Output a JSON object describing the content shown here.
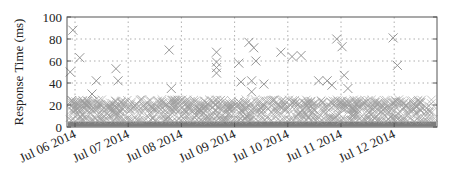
{
  "chart_data": {
    "type": "scatter",
    "title": "",
    "xlabel": "",
    "ylabel": "Response Time (ms)",
    "ylim": [
      0,
      100
    ],
    "yticks": [
      0,
      20,
      40,
      60,
      80,
      100
    ],
    "xticks": [
      "Jul 06 2014",
      "Jul 07 2014",
      "Jul 08 2014",
      "Jul 09 2014",
      "Jul 10 2014",
      "Jul 11 2014",
      "Jul 12 2014"
    ],
    "xlim_days": [
      -0.15,
      6.85
    ],
    "grid": true,
    "legend": null,
    "marker": "x",
    "series": [
      {
        "name": "response_time",
        "description": "Dense band of samples 0-5 ms across full range plus crowded cluster around 15-25 ms",
        "dense_band_ms": [
          0,
          5
        ],
        "cluster_band_ms": [
          15,
          25
        ],
        "outliers": [
          {
            "day": -0.04,
            "ms": 88
          },
          {
            "day": 0.09,
            "ms": 63
          },
          {
            "day": -0.09,
            "ms": 50
          },
          {
            "day": 0.4,
            "ms": 42
          },
          {
            "day": 0.32,
            "ms": 30
          },
          {
            "day": 0.77,
            "ms": 53
          },
          {
            "day": 0.81,
            "ms": 42
          },
          {
            "day": 1.77,
            "ms": 70
          },
          {
            "day": 1.81,
            "ms": 35
          },
          {
            "day": 2.66,
            "ms": 68
          },
          {
            "day": 2.66,
            "ms": 59
          },
          {
            "day": 2.66,
            "ms": 54
          },
          {
            "day": 2.66,
            "ms": 49
          },
          {
            "day": 3.08,
            "ms": 58
          },
          {
            "day": 3.27,
            "ms": 77
          },
          {
            "day": 3.36,
            "ms": 72
          },
          {
            "day": 3.4,
            "ms": 60
          },
          {
            "day": 3.12,
            "ms": 41
          },
          {
            "day": 3.32,
            "ms": 42
          },
          {
            "day": 3.55,
            "ms": 39
          },
          {
            "day": 3.32,
            "ms": 32
          },
          {
            "day": 3.87,
            "ms": 68
          },
          {
            "day": 4.08,
            "ms": 64
          },
          {
            "day": 4.25,
            "ms": 65
          },
          {
            "day": 4.92,
            "ms": 80
          },
          {
            "day": 5.02,
            "ms": 73
          },
          {
            "day": 4.58,
            "ms": 42
          },
          {
            "day": 4.74,
            "ms": 42
          },
          {
            "day": 4.83,
            "ms": 38
          },
          {
            "day": 5.06,
            "ms": 47
          },
          {
            "day": 5.13,
            "ms": 35
          },
          {
            "day": 5.98,
            "ms": 81
          },
          {
            "day": 6.06,
            "ms": 56
          }
        ]
      }
    ]
  },
  "axes": {
    "ylabel": "Response Time (ms)",
    "yticks": [
      "0",
      "20",
      "40",
      "60",
      "80",
      "100"
    ],
    "xticks": [
      "Jul 06 2014",
      "Jul 07 2014",
      "Jul 08 2014",
      "Jul 09 2014",
      "Jul 10 2014",
      "Jul 11 2014",
      "Jul 12 2014"
    ]
  },
  "colors": {
    "marker": "#8a8a8a",
    "base_band": "#7d7d7d",
    "grid": "#9a9a9a",
    "frame": "#555555"
  }
}
